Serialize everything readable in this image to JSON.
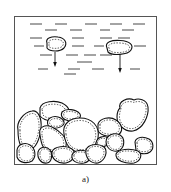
{
  "figure": {
    "caption": "a)",
    "colors": {
      "line": "#111111",
      "frame": "#555555",
      "background": "#ffffff"
    },
    "elements": {
      "container": "rectangular-tank",
      "liquid_lines": "dashed-horizontal-strokes",
      "falling_particles": 2,
      "settled_particles": "sediment-pile",
      "arrows": 2
    }
  }
}
